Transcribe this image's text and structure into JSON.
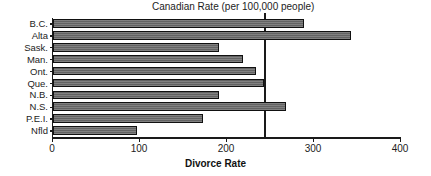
{
  "chart_data": {
    "type": "bar",
    "orientation": "horizontal",
    "title": "Canadian Rate (per 100,000 people)",
    "xlabel": "Divorce Rate",
    "ylabel": "",
    "categories": [
      "B.C.",
      "Alta",
      "Sask.",
      "Man.",
      "Ont.",
      "Que.",
      "N.B.",
      "N.S.",
      "P.E.I.",
      "Nfld"
    ],
    "values": [
      288,
      343,
      191,
      218,
      233,
      243,
      191,
      268,
      172,
      96
    ],
    "xlim": [
      0,
      400
    ],
    "xticks": [
      0,
      100,
      200,
      300,
      400
    ],
    "xtick_labels": [
      "0",
      "100",
      "200",
      "300",
      "400"
    ],
    "grid": false,
    "legend": false,
    "annotations": [
      {
        "name": "canadian-rate-reference-line",
        "label": "Canadian Rate (per 100,000 people)",
        "value": 244,
        "orientation": "vertical"
      }
    ],
    "colors": {
      "bar_fill": "#6e6e6e",
      "bar_edge": "#111111",
      "axis": "#1a1a1a",
      "text": "#1c1c1c",
      "background": "#ffffff"
    }
  }
}
